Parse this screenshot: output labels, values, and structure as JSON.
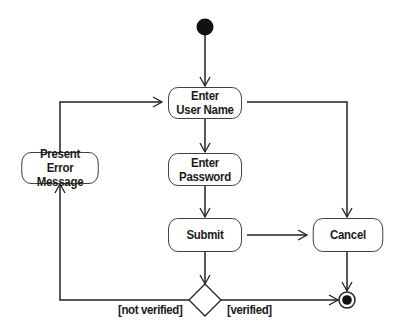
{
  "diagram": {
    "type": "UML activity diagram",
    "colors": {
      "line": "#222222",
      "node_fill": "#ffffff",
      "text": "#1a1a1a",
      "initial_node": "#111111"
    },
    "nodes": {
      "initial": {
        "kind": "initial-node"
      },
      "enter_user_name": {
        "line1": "Enter",
        "line2": "User Name"
      },
      "enter_password": {
        "line1": "Enter",
        "line2": "Password"
      },
      "submit": {
        "label": "Submit"
      },
      "cancel": {
        "label": "Cancel"
      },
      "present_error": {
        "line1": "Present",
        "line2": "Error Message"
      },
      "decision": {
        "kind": "decision-node"
      },
      "final": {
        "kind": "final-node"
      }
    },
    "guards": {
      "not_verified": "[not verified]",
      "verified": "[verified]"
    },
    "edges": [
      {
        "from": "initial",
        "to": "enter_user_name"
      },
      {
        "from": "enter_user_name",
        "to": "enter_password"
      },
      {
        "from": "enter_user_name",
        "to": "cancel"
      },
      {
        "from": "enter_password",
        "to": "submit"
      },
      {
        "from": "submit",
        "to": "cancel"
      },
      {
        "from": "submit",
        "to": "decision"
      },
      {
        "from": "decision",
        "to": "present_error",
        "guard": "[not verified]"
      },
      {
        "from": "decision",
        "to": "final",
        "guard": "[verified]"
      },
      {
        "from": "present_error",
        "to": "enter_user_name"
      },
      {
        "from": "cancel",
        "to": "final"
      }
    ]
  }
}
